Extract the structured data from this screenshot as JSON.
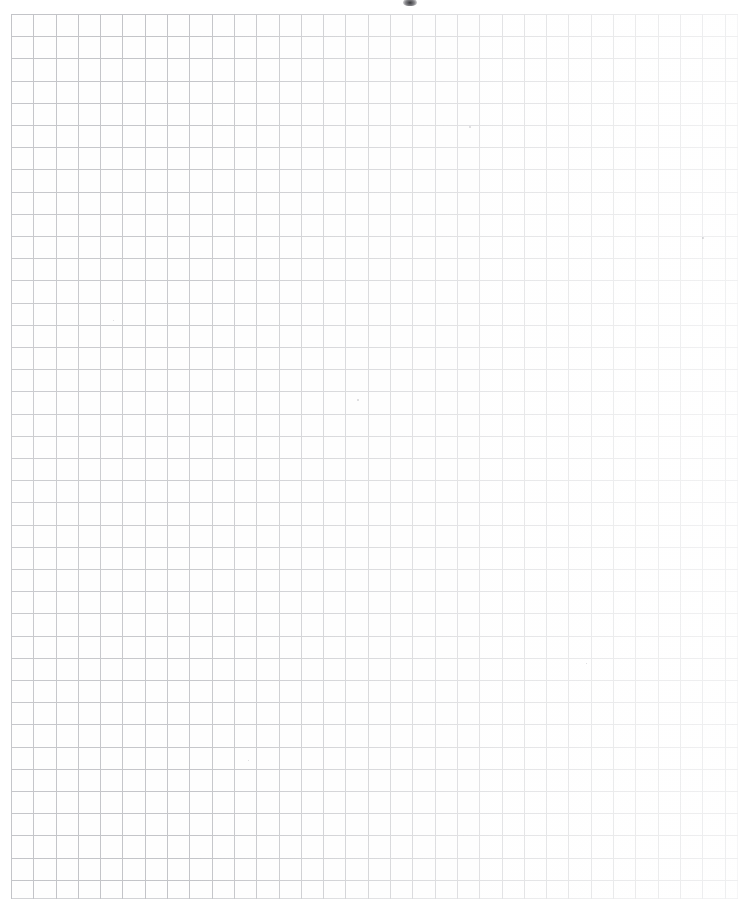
{
  "document": {
    "kind": "scanned-graph-paper",
    "title": "Graph Paper Sheet",
    "orientation": "portrait",
    "page_width_px": 751,
    "page_height_px": 912,
    "background_color": "#ffffff",
    "paper_tone": "#fefefe"
  },
  "grid": {
    "line_color": "#c3c4c8",
    "line_width_px": 1,
    "cell_width_px": 22.3,
    "cell_height_px": 22.2,
    "left_px": 11,
    "top_px": 14,
    "right_px": 737,
    "bottom_px": 898,
    "columns": 33,
    "rows": 40,
    "major_gridlines": false,
    "labels": false,
    "axis_numbers": false
  },
  "ink_fade": {
    "description": "scan ink density falls off from left to right",
    "darkest_edge": "left",
    "lightest_edge": "right"
  },
  "artifacts": {
    "smudge": {
      "name": "top-center scanner smudge",
      "x_px": 403,
      "y_px": -2,
      "width_px": 14,
      "height_px": 8
    },
    "specks": [
      {
        "x_px": 469,
        "y_px": 126,
        "size_px": 2
      },
      {
        "x_px": 702,
        "y_px": 237,
        "size_px": 2
      },
      {
        "x_px": 357,
        "y_px": 399,
        "size_px": 2
      },
      {
        "x_px": 113,
        "y_px": 320,
        "size_px": 1
      },
      {
        "x_px": 586,
        "y_px": 663,
        "size_px": 1
      },
      {
        "x_px": 248,
        "y_px": 760,
        "size_px": 1
      }
    ]
  },
  "caption": "Blank scanned graph paper, 33 by 40 squares, no printed text or data."
}
